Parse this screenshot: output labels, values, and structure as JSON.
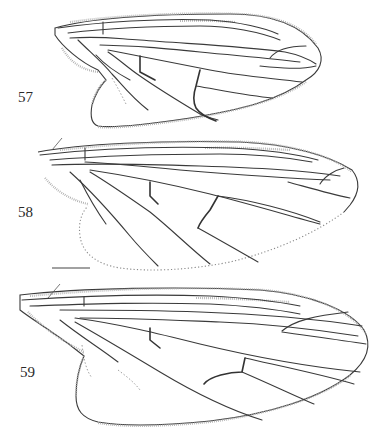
{
  "plate": {
    "figures": [
      {
        "id": "fig-57",
        "label": "57"
      },
      {
        "id": "fig-58",
        "label": "58"
      },
      {
        "id": "fig-59",
        "label": "59"
      }
    ],
    "scale_bar": {
      "label": ""
    },
    "colors": {
      "ink": "#3a3a3a",
      "background": "#ffffff",
      "dotted_margin": "#888888"
    }
  }
}
